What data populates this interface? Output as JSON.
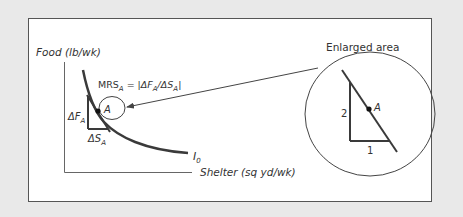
{
  "figure": {
    "y_axis_label": "Food (lb/wk)",
    "x_axis_label": "Shelter (sq yd/wk)",
    "curve_label": "I",
    "curve_label_sub": "0",
    "point_label": "A",
    "mrs_formula": {
      "lhs": "MRS",
      "lhs_sub": "A",
      "equals": " = |",
      "num": "ΔF",
      "num_sub": "A",
      "slash": "/",
      "den": "ΔS",
      "den_sub": "A",
      "close": "|"
    },
    "delta_f_label": "ΔF",
    "delta_f_sub": "A",
    "delta_s_label": "ΔS",
    "delta_s_sub": "A",
    "enlarged": {
      "title": "Enlarged area",
      "rise_label": "2",
      "run_label": "1",
      "point_label": "A"
    },
    "colors": {
      "background": "#e9e9e9",
      "panel": "#ffffff",
      "frame": "#555555",
      "curve": "#3a3a3a",
      "text": "#333333"
    }
  }
}
